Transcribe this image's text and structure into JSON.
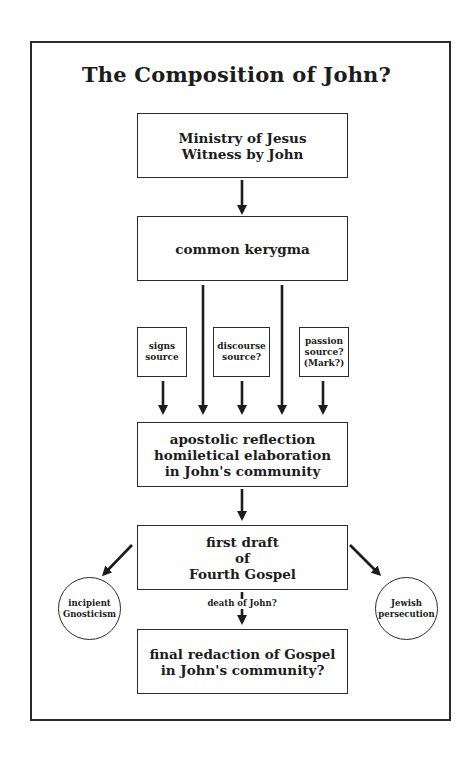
{
  "title": "The Composition of John?",
  "colors": {
    "ink": "#2a2a2a",
    "background": "#ffffff"
  },
  "nodes": {
    "ministry": "Ministry of Jesus\nWitness by John",
    "kerygma": "common kerygma",
    "signs_source": "signs\nsource",
    "discourse_source": "discourse\nsource?",
    "passion_source": "passion\nsource?\n(Mark?)",
    "apostolic_reflection": "apostolic reflection\nhomiletical elaboration\nin John's community",
    "first_draft": "first draft\nof\nFourth Gospel",
    "gnosticism": "incipient\nGnosticism",
    "jewish_persecution": "Jewish\npersecution",
    "final_redaction": "final redaction of Gospel\nin John's community?"
  },
  "edge_labels": {
    "death_of_john": "death of John?"
  },
  "edges": [
    {
      "from": "ministry",
      "to": "kerygma"
    },
    {
      "from": "kerygma",
      "to": "apostolic_reflection"
    },
    {
      "from": "kerygma",
      "to": "apostolic_reflection"
    },
    {
      "from": "signs_source",
      "to": "apostolic_reflection"
    },
    {
      "from": "discourse_source",
      "to": "apostolic_reflection"
    },
    {
      "from": "passion_source",
      "to": "apostolic_reflection"
    },
    {
      "from": "apostolic_reflection",
      "to": "first_draft"
    },
    {
      "from": "first_draft",
      "to": "gnosticism"
    },
    {
      "from": "first_draft",
      "to": "jewish_persecution"
    },
    {
      "from": "first_draft",
      "to": "final_redaction",
      "label": "death of John?"
    }
  ]
}
